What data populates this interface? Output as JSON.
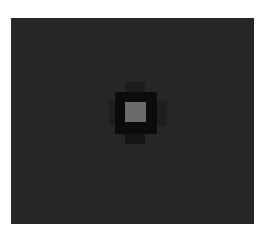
{
  "image": {
    "description": "Dark grayscale field with a single bright square feature at center surrounded by a darker halo",
    "colors": {
      "page_background": "#ffffff",
      "field": "#262626",
      "halo_outer": "#1e1e1e",
      "halo_inner": "#0c0c0c",
      "core": "#6a6a6a"
    }
  }
}
